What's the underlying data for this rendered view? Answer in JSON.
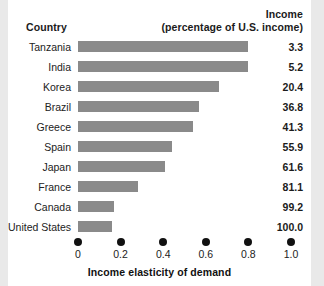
{
  "chart_data": {
    "type": "bar",
    "orientation": "horizontal",
    "title": "",
    "xlabel": "Income elasticity of demand",
    "ylabel": "Country",
    "xlim": [
      0,
      1.0
    ],
    "grid": false,
    "legend": null,
    "column_headers": {
      "country": "Country",
      "income_line1": "Income",
      "income_line2": "(percentage of U.S. income)"
    },
    "xticks": [
      "0",
      "0.2",
      "0.4",
      "0.6",
      "0.8",
      "1.0"
    ],
    "xtick_values": [
      0,
      0.2,
      0.4,
      0.6,
      0.8,
      1.0
    ],
    "categories": [
      "Tanzania",
      "India",
      "Korea",
      "Brazil",
      "Greece",
      "Spain",
      "Japan",
      "France",
      "Canada",
      "United States"
    ],
    "values": [
      0.8,
      0.8,
      0.66,
      0.57,
      0.54,
      0.44,
      0.41,
      0.28,
      0.17,
      0.16
    ],
    "secondary_series": {
      "name": "Income (percentage of U.S. income)",
      "values": [
        "3.3",
        "5.2",
        "20.4",
        "36.8",
        "41.3",
        "55.9",
        "61.6",
        "81.1",
        "99.2",
        "100.0"
      ]
    },
    "colors": {
      "bar": "#8a8a8a",
      "text": "#222222",
      "tick_dot": "#111111",
      "panel_background": "#ffffff",
      "page_background": "#e9e9e9"
    }
  }
}
